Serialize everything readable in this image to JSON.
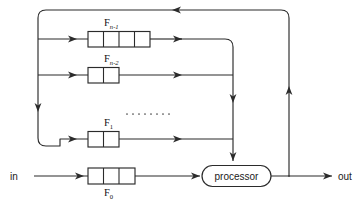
{
  "diagram": {
    "background_color": "#ffffff",
    "line_color": "#2b2b2b",
    "io": {
      "input_label": "in",
      "output_label": "out"
    },
    "processor": {
      "label": "processor",
      "shape": "rounded-capsule"
    },
    "ellipsis": {
      "glyph": "........",
      "dot_count": 8
    },
    "registers": [
      {
        "id": "f-n-1",
        "name_base": "F",
        "subscript": "n-1",
        "subscript_parts": {
          "variable": "n",
          "operator": "–",
          "number": "1"
        },
        "cells": 4,
        "label_position": "above"
      },
      {
        "id": "f-n-2",
        "name_base": "F",
        "subscript": "n-2",
        "subscript_parts": {
          "variable": "n",
          "operator": "–",
          "number": "2"
        },
        "cells": 2,
        "label_position": "above"
      },
      {
        "id": "f-1",
        "name_base": "F",
        "subscript": "1",
        "subscript_parts": {
          "variable": "",
          "operator": "",
          "number": "1"
        },
        "cells": 2,
        "label_position": "above"
      },
      {
        "id": "f-0",
        "name_base": "F",
        "subscript": "0",
        "subscript_parts": {
          "variable": "",
          "operator": "",
          "number": "0"
        },
        "cells": 3,
        "label_position": "below"
      }
    ]
  }
}
